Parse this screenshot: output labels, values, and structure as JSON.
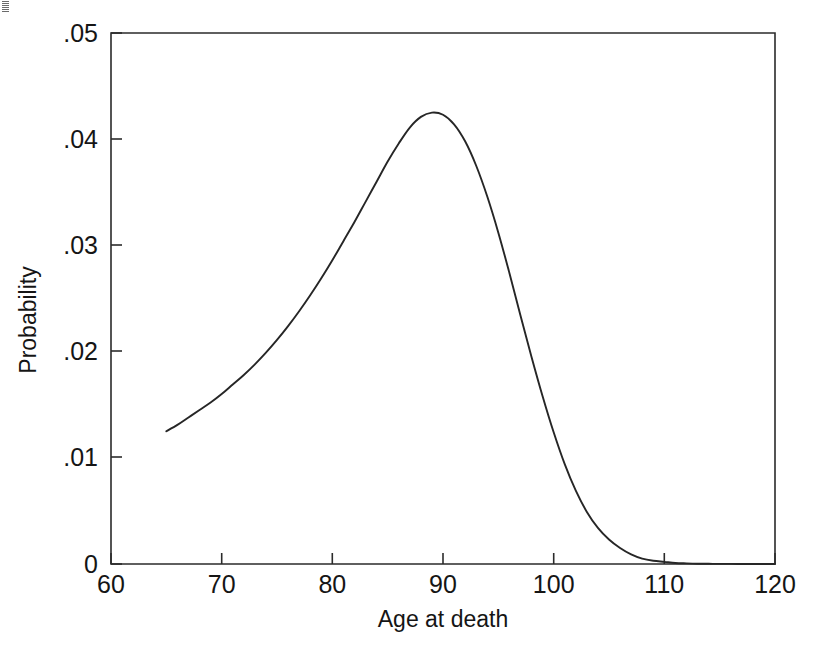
{
  "figure": {
    "background_color": "#ffffff",
    "ink_color": "#262626",
    "width": 822,
    "height": 658
  },
  "chart_data": {
    "type": "line",
    "title": "",
    "subtitle": "",
    "xlabel": "Age at death",
    "ylabel": "Probability",
    "xlim": [
      60,
      120
    ],
    "ylim": [
      0,
      0.05
    ],
    "grid": false,
    "legend": null,
    "legend_position": "none",
    "xticks": [
      60,
      70,
      80,
      90,
      100,
      110,
      120
    ],
    "xtick_labels": [
      "60",
      "70",
      "80",
      "90",
      "100",
      "110",
      "120"
    ],
    "yticks": [
      0,
      0.01,
      0.02,
      0.03,
      0.04,
      0.05
    ],
    "ytick_labels": [
      "0",
      ".01",
      ".02",
      ".03",
      ".04",
      ".05"
    ],
    "series": [
      {
        "name": "Probability of death at age",
        "color": "#262626",
        "line_style": "solid",
        "x": [
          65,
          66,
          67,
          68,
          69,
          70,
          71,
          72,
          73,
          74,
          75,
          76,
          77,
          78,
          79,
          80,
          81,
          82,
          83,
          84,
          85,
          86,
          87,
          88,
          89,
          90,
          91,
          92,
          93,
          94,
          95,
          96,
          97,
          98,
          99,
          100,
          101,
          102,
          103,
          104,
          105,
          106,
          107,
          108,
          109,
          110,
          111,
          112,
          113,
          114,
          115,
          116,
          117,
          118,
          119,
          120
        ],
        "values": [
          0.0125,
          0.0131,
          0.0138,
          0.0145,
          0.0152,
          0.016,
          0.0169,
          0.0178,
          0.0188,
          0.0199,
          0.0211,
          0.0224,
          0.0238,
          0.0253,
          0.0269,
          0.0286,
          0.0304,
          0.0322,
          0.0341,
          0.036,
          0.0379,
          0.0396,
          0.0411,
          0.0421,
          0.0425,
          0.0423,
          0.0414,
          0.0398,
          0.0375,
          0.0346,
          0.0312,
          0.0274,
          0.0234,
          0.0195,
          0.0158,
          0.0124,
          0.0094,
          0.0069,
          0.0049,
          0.0034,
          0.0023,
          0.0015,
          0.0009,
          0.0005,
          0.0003,
          0.0002,
          0.0001,
          6e-05,
          3e-05,
          2e-05,
          1e-05,
          1e-05,
          5e-06,
          2e-06,
          1e-06,
          5e-07
        ]
      }
    ],
    "annotations": {
      "peak_x": 89,
      "peak_y": 0.0425,
      "curve_start_x": 65,
      "curve_start_y": 0.0125,
      "curve_end_x": 120,
      "curve_end_y": 0.0
    }
  }
}
